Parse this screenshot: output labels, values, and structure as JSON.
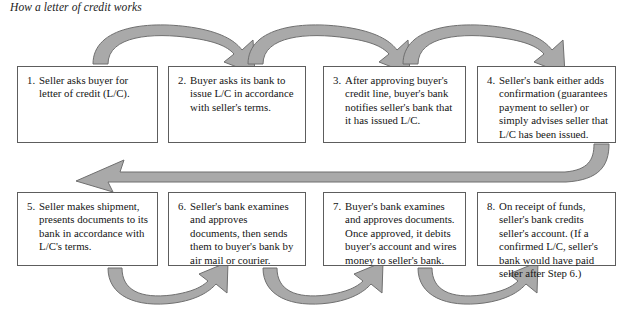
{
  "figure": {
    "title": "How a letter of credit works",
    "arrow_fill": "#a9a9a9",
    "arrow_stroke": "#6f6f6f",
    "box_border": "#5d5d5d",
    "text_color": "#141414"
  },
  "steps": [
    {
      "number": "1.",
      "text": "Seller asks buyer for letter of credit (L/C)."
    },
    {
      "number": "2.",
      "text": "Buyer asks its bank to issue L/C in accordance with seller's terms."
    },
    {
      "number": "3.",
      "text": "After approving buyer's credit line, buyer's bank notifies seller's bank that it has issued L/C."
    },
    {
      "number": "4.",
      "text": "Seller's bank either adds confirmation (guarantees payment to seller) or simply advises seller that L/C has been issued."
    },
    {
      "number": "5.",
      "text": "Seller makes shipment, presents documents to its bank in accordance with L/C's terms."
    },
    {
      "number": "6.",
      "text": "Seller's bank examines and approves documents, then sends them to buyer's bank by air mail or courier."
    },
    {
      "number": "7.",
      "text": "Buyer's bank examines and approves documents. Once approved, it debits buyer's account and wires money to seller's bank."
    },
    {
      "number": "8.",
      "text": "On receipt of funds, seller's bank credits seller's account. (If a confirmed L/C, seller's bank would have paid seller after Step 6.)"
    }
  ],
  "connectors": [
    {
      "name": "arrow-step-1-to-2",
      "direction": "arc-right",
      "from": "1",
      "to": "2"
    },
    {
      "name": "arrow-step-2-to-3",
      "direction": "arc-right",
      "from": "2",
      "to": "3"
    },
    {
      "name": "arrow-step-3-to-4",
      "direction": "arc-right",
      "from": "3",
      "to": "4"
    },
    {
      "name": "arrow-step-4-to-5",
      "direction": "wrap-left",
      "from": "4",
      "to": "5"
    },
    {
      "name": "arrow-step-5-to-6",
      "direction": "arc-right-under",
      "from": "5",
      "to": "6"
    },
    {
      "name": "arrow-step-6-to-7",
      "direction": "arc-right-under",
      "from": "6",
      "to": "7"
    },
    {
      "name": "arrow-step-7-to-8",
      "direction": "arc-right-under",
      "from": "7",
      "to": "8"
    }
  ]
}
